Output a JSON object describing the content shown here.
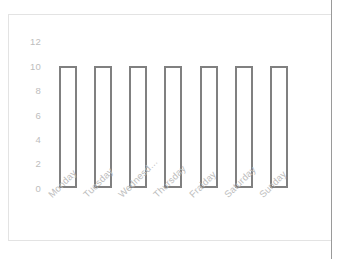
{
  "chart_data": {
    "type": "bar",
    "title": "",
    "subtitle": "",
    "xlabel": "",
    "ylabel": "",
    "categories": [
      "Monday",
      "Tuesday",
      "Wednesd…",
      "Thursday",
      "Fraiday",
      "Saturday",
      "Sunday"
    ],
    "values": [
      10,
      10,
      10,
      10,
      10,
      10,
      10
    ],
    "ylim": [
      0,
      12
    ],
    "yticks": [
      0,
      2,
      4,
      6,
      8,
      10,
      12
    ],
    "ytick_labels": [
      "0",
      "2",
      "4",
      "6",
      "8",
      "10",
      "12"
    ],
    "grid": false,
    "legend": false,
    "legend_position": "none",
    "bar_style": {
      "fill": "#ffffff",
      "border": "#808080",
      "border_width": 2
    },
    "xtick_rotation": -45,
    "tick_label_color": "#bdbdbd",
    "background": "#ffffff",
    "annotations": []
  }
}
